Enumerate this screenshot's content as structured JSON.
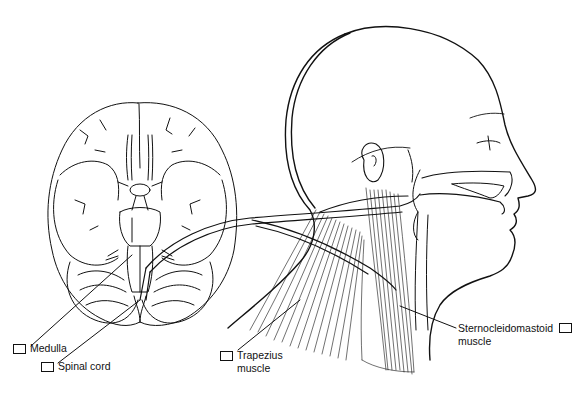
{
  "diagram": {
    "colors": {
      "line": "#111111",
      "background": "#ffffff"
    },
    "labels": [
      {
        "id": "medulla",
        "text": "Medulla",
        "checked": false
      },
      {
        "id": "spinal-cord",
        "text": "Spinal cord",
        "checked": false
      },
      {
        "id": "trapezius",
        "line1": "Trapezius",
        "line2": "muscle",
        "checked": false
      },
      {
        "id": "sternocleidomastoid",
        "line1": "Sternocleidomastoid",
        "line2": "muscle",
        "checked": false
      }
    ]
  }
}
